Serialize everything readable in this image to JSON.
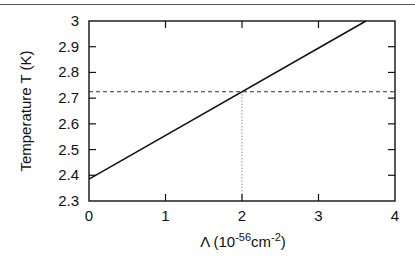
{
  "chart_data": {
    "type": "line",
    "title": "",
    "xlabel": "Λ (10^-56 cm^-2)",
    "xlabel_parts": {
      "symbol": "Λ (10",
      "exp1": "-56",
      "mid": "cm",
      "exp2": "-2",
      "end": ")"
    },
    "ylabel": "Temperature T (K)",
    "xlim": [
      0,
      4
    ],
    "ylim": [
      2.3,
      3.0
    ],
    "x_ticks": [
      "0",
      "1",
      "2",
      "3",
      "4"
    ],
    "y_ticks": [
      "2.3",
      "2.4",
      "2.5",
      "2.6",
      "2.7",
      "2.8",
      "2.9",
      "3"
    ],
    "grid": false,
    "series": [
      {
        "name": "T(Λ)",
        "style": "solid",
        "x": [
          0,
          3.62
        ],
        "y": [
          2.385,
          3.0
        ]
      },
      {
        "name": "T = 2.725 K (observed)",
        "style": "dashed",
        "x": [
          0,
          4
        ],
        "y": [
          2.725,
          2.725
        ]
      },
      {
        "name": "Λ = 2",
        "style": "dotted",
        "x": [
          2,
          2
        ],
        "y": [
          2.3,
          2.725
        ]
      }
    ]
  }
}
